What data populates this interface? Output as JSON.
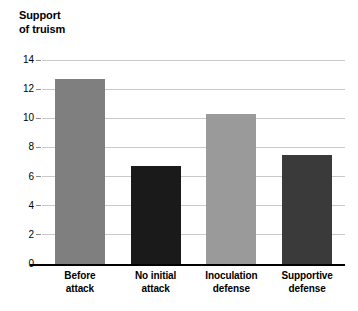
{
  "chart_data": {
    "type": "bar",
    "title_lines": [
      "Support",
      "of truism"
    ],
    "xlabel": "",
    "ylabel": "Support of truism",
    "ylim": [
      0,
      14
    ],
    "ytick_labels": [
      "0",
      "2",
      "4",
      "6",
      "8",
      "10",
      "12",
      "14"
    ],
    "ytick_values": [
      0,
      2,
      4,
      6,
      8,
      10,
      12,
      14
    ],
    "grid": true,
    "legend": "none",
    "categories": [
      "Before attack",
      "No initial attack",
      "Inoculation defense",
      "Supportive defense"
    ],
    "category_lines": [
      [
        "Before",
        "attack"
      ],
      [
        "No initial",
        "attack"
      ],
      [
        "Inoculation",
        "defense"
      ],
      [
        "Supportive",
        "defense"
      ]
    ],
    "values": [
      12.7,
      6.7,
      10.3,
      7.5
    ],
    "bar_colors": [
      "#7f7f7f",
      "#1a1a1a",
      "#9a9a9a",
      "#3a3a3a"
    ],
    "bars": [
      {
        "label": "Before attack",
        "value": 12.7,
        "color": "#7f7f7f"
      },
      {
        "label": "No initial attack",
        "value": 6.7,
        "color": "#1a1a1a"
      },
      {
        "label": "Inoculation defense",
        "value": 10.3,
        "color": "#9a9a9a"
      },
      {
        "label": "Supportive defense",
        "value": 7.5,
        "color": "#3a3a3a"
      }
    ]
  },
  "colors": {
    "background": "#ffffff",
    "axis": "#000000",
    "gridline": "#c9c9c9",
    "text": "#000000"
  }
}
